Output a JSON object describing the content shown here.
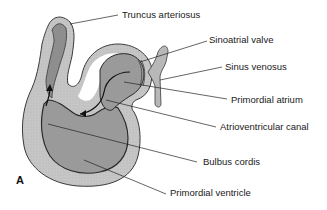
{
  "figure": {
    "panel_letter": "A",
    "colors": {
      "outer_wall": "#c4c4c4",
      "inner_wall": "#8e8e8e",
      "lumen": "#9a9a9a",
      "outline": "#3a3a3a",
      "label_text": "#1a1a1a",
      "background": "#ffffff"
    },
    "labels": [
      {
        "id": "truncus-arteriosus",
        "text": "Truncus arteriosus"
      },
      {
        "id": "sinoatrial-valve",
        "text": "Sinoatrial valve"
      },
      {
        "id": "sinus-venosus",
        "text": "Sinus venosus"
      },
      {
        "id": "primordial-atrium",
        "text": "Primordial atrium"
      },
      {
        "id": "atrioventricular-canal",
        "text": "Atrioventricular canal"
      },
      {
        "id": "bulbus-cordis",
        "text": "Bulbus cordis"
      },
      {
        "id": "primordial-ventricle",
        "text": "Primordial ventricle"
      }
    ]
  }
}
